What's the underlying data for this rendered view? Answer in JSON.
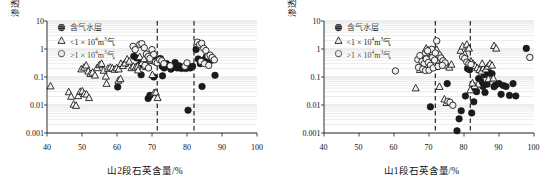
{
  "figure": {
    "panel_count": 2
  },
  "chart_data": [
    {
      "type": "scatter",
      "panel": "left",
      "title": "",
      "xlabel": "山2段石英含量/%",
      "ylabel": "渗透率/10-3μm2",
      "ylabel_main": "渗透率/10",
      "ylabel_exp": "-3",
      "ylabel_unit": "μm",
      "ylabel_unit_exp": "2",
      "xlim": [
        40,
        100
      ],
      "ylim": [
        0.001,
        10
      ],
      "yscale": "log",
      "xticks": [
        40,
        50,
        60,
        70,
        80,
        90,
        100
      ],
      "xticklabels": [
        "40",
        "50",
        "60",
        "70",
        "80",
        "90",
        "100"
      ],
      "yticks": [
        0.001,
        0.01,
        0.1,
        1,
        10
      ],
      "yticklabels": [
        "0.001",
        "0.01",
        "0.1",
        "1",
        "10"
      ],
      "grid": "horizontal-minor",
      "legend_position": "upper-left",
      "annotations": [
        {
          "type": "vline",
          "x": 71.5,
          "style": "dashed"
        },
        {
          "type": "vline",
          "x": 82.0,
          "style": "dashed"
        }
      ],
      "series": [
        {
          "name": "含气水层",
          "marker": "filled-circle",
          "points": [
            [
              60.2,
              0.044
            ],
            [
              62.5,
              0.3
            ],
            [
              64.8,
              0.55
            ],
            [
              65.6,
              0.48
            ],
            [
              66.3,
              0.26
            ],
            [
              67.0,
              0.34
            ],
            [
              68.2,
              0.31
            ],
            [
              68.9,
              0.017
            ],
            [
              69.4,
              0.022
            ],
            [
              70.1,
              0.38
            ],
            [
              70.8,
              0.44
            ],
            [
              71.2,
              0.42
            ],
            [
              71.9,
              0.4
            ],
            [
              72.4,
              0.46
            ],
            [
              72.9,
              0.24
            ],
            [
              73.5,
              0.21
            ],
            [
              74.1,
              0.3
            ],
            [
              74.8,
              0.26
            ],
            [
              75.4,
              0.19
            ],
            [
              75.9,
              0.22
            ],
            [
              76.6,
              0.33
            ],
            [
              77.2,
              0.21
            ],
            [
              77.8,
              0.25
            ],
            [
              78.4,
              0.2
            ],
            [
              79.0,
              0.22
            ],
            [
              79.7,
              0.2
            ],
            [
              80.3,
              0.0065
            ],
            [
              80.9,
              0.21
            ],
            [
              81.6,
              0.24
            ],
            [
              82.6,
              0.96
            ],
            [
              83.2,
              0.44
            ],
            [
              83.8,
              0.3
            ],
            [
              84.3,
              0.046
            ],
            [
              84.9,
              0.41
            ],
            [
              85.5,
              0.52
            ],
            [
              86.1,
              0.34
            ],
            [
              86.7,
              0.38
            ],
            [
              87.3,
              0.47
            ],
            [
              88.0,
              0.115
            ],
            [
              70.5,
              0.1
            ],
            [
              73.0,
              0.11
            ],
            [
              66.9,
              0.12
            ]
          ]
        },
        {
          "name": "<1 × 104m3气",
          "marker": "triangle",
          "points": [
            [
              41.0,
              0.047
            ],
            [
              46.2,
              0.029
            ],
            [
              46.9,
              0.02
            ],
            [
              47.6,
              0.0105
            ],
            [
              48.3,
              0.0095
            ],
            [
              48.9,
              0.021
            ],
            [
              49.5,
              0.03
            ],
            [
              50.1,
              0.031
            ],
            [
              50.7,
              0.025
            ],
            [
              51.3,
              0.024
            ],
            [
              52.0,
              0.018
            ],
            [
              49.8,
              0.19
            ],
            [
              50.6,
              0.22
            ],
            [
              51.2,
              0.26
            ],
            [
              51.8,
              0.16
            ],
            [
              52.4,
              0.13
            ],
            [
              53.0,
              0.145
            ],
            [
              53.7,
              0.115
            ],
            [
              54.3,
              0.21
            ],
            [
              55.0,
              0.27
            ],
            [
              55.6,
              0.3
            ],
            [
              56.2,
              0.17
            ],
            [
              56.8,
              0.105
            ],
            [
              57.4,
              0.2
            ],
            [
              58.1,
              0.22
            ],
            [
              58.7,
              0.205
            ],
            [
              59.3,
              0.185
            ],
            [
              59.9,
              0.21
            ],
            [
              60.5,
              0.19
            ],
            [
              61.1,
              0.3
            ],
            [
              61.7,
              0.25
            ],
            [
              62.3,
              0.31
            ],
            [
              62.9,
              0.43
            ],
            [
              63.5,
              0.36
            ],
            [
              64.1,
              0.21
            ],
            [
              64.7,
              0.24
            ],
            [
              65.3,
              0.22
            ],
            [
              65.9,
              0.24
            ],
            [
              66.5,
              0.52
            ],
            [
              67.1,
              0.32
            ],
            [
              67.7,
              0.44
            ],
            [
              68.3,
              0.23
            ],
            [
              68.9,
              0.24
            ],
            [
              69.5,
              0.4
            ],
            [
              70.1,
              0.12
            ],
            [
              70.6,
              0.027
            ],
            [
              71.1,
              0.028
            ],
            [
              71.6,
              0.018
            ],
            [
              60.4,
              0.075
            ],
            [
              61.0,
              0.085
            ],
            [
              57.0,
              0.058
            ],
            [
              66.0,
              0.175
            ],
            [
              72.1,
              0.42
            ]
          ]
        },
        {
          "name": ">1 × 104m3气",
          "marker": "open-circle",
          "points": [
            [
              64.6,
              1.25
            ],
            [
              65.2,
              0.95
            ],
            [
              66.5,
              1.45
            ],
            [
              67.1,
              1.55
            ],
            [
              67.8,
              1.1
            ],
            [
              68.4,
              0.66
            ],
            [
              68.9,
              0.54
            ],
            [
              69.4,
              0.46
            ],
            [
              70.0,
              0.95
            ],
            [
              70.5,
              0.64
            ],
            [
              71.0,
              0.34
            ],
            [
              71.5,
              0.32
            ],
            [
              72.2,
              0.41
            ],
            [
              72.8,
              0.38
            ],
            [
              73.4,
              0.3
            ],
            [
              75.2,
              0.25
            ],
            [
              79.4,
              0.24
            ],
            [
              80.0,
              0.32
            ],
            [
              83.0,
              1.75
            ],
            [
              83.6,
              1.45
            ],
            [
              84.2,
              1.6
            ],
            [
              84.8,
              1.05
            ],
            [
              85.4,
              0.88
            ],
            [
              86.0,
              0.56
            ],
            [
              86.6,
              0.6
            ],
            [
              87.2,
              0.5
            ],
            [
              87.8,
              0.41
            ],
            [
              84.0,
              0.36
            ],
            [
              85.0,
              0.3
            ],
            [
              86.2,
              0.26
            ],
            [
              68.0,
              0.26
            ],
            [
              69.0,
              0.21
            ]
          ]
        }
      ]
    },
    {
      "type": "scatter",
      "panel": "right",
      "title": "",
      "xlabel": "山1段石英含量/%",
      "ylabel": "渗透率/10-3μm2",
      "ylabel_main": "渗透率/10",
      "ylabel_exp": "-3",
      "ylabel_unit": "μm",
      "ylabel_unit_exp": "2",
      "xlim": [
        40,
        100
      ],
      "ylim": [
        0.001,
        10
      ],
      "yscale": "log",
      "xticks": [
        40,
        50,
        60,
        70,
        80,
        90,
        100
      ],
      "xticklabels": [
        "40",
        "50",
        "60",
        "70",
        "80",
        "90",
        "100"
      ],
      "yticks": [
        0.001,
        0.01,
        0.1,
        1,
        10
      ],
      "yticklabels": [
        "0.001",
        "0.01",
        "0.1",
        "1",
        "10"
      ],
      "grid": "horizontal-minor",
      "legend_position": "upper-left",
      "annotations": [
        {
          "type": "vline",
          "x": 71.8,
          "style": "dashed"
        },
        {
          "type": "vline",
          "x": 81.8,
          "style": "dashed"
        }
      ],
      "series": [
        {
          "name": "含气水层",
          "marker": "filled-circle",
          "points": [
            [
              70.4,
              0.0086
            ],
            [
              75.2,
              0.058
            ],
            [
              78.0,
              0.0012
            ],
            [
              78.6,
              0.0032
            ],
            [
              79.2,
              0.0062
            ],
            [
              80.4,
              0.021
            ],
            [
              81.0,
              0.2
            ],
            [
              81.6,
              0.18
            ],
            [
              82.2,
              0.0052
            ],
            [
              83.0,
              0.042
            ],
            [
              83.6,
              0.03
            ],
            [
              84.2,
              0.088
            ],
            [
              84.8,
              0.07
            ],
            [
              85.4,
              0.046
            ],
            [
              86.0,
              0.028
            ],
            [
              86.6,
              0.055
            ],
            [
              87.2,
              0.14
            ],
            [
              88.0,
              0.13
            ],
            [
              89.0,
              0.052
            ],
            [
              90.0,
              0.058
            ],
            [
              90.6,
              0.024
            ],
            [
              91.2,
              0.05
            ],
            [
              92.0,
              0.046
            ],
            [
              93.0,
              0.022
            ],
            [
              94.0,
              0.058
            ],
            [
              94.8,
              0.021
            ],
            [
              97.8,
              1.05
            ],
            [
              82.8,
              0.013
            ],
            [
              85.8,
              0.12
            ],
            [
              88.6,
              0.045
            ]
          ]
        },
        {
          "name": "<1 × 104m3气",
          "marker": "triangle",
          "points": [
            [
              66.2,
              0.04
            ],
            [
              68.0,
              0.46
            ],
            [
              68.6,
              0.72
            ],
            [
              69.2,
              1.05
            ],
            [
              69.8,
              0.9
            ],
            [
              70.4,
              0.55
            ],
            [
              71.0,
              0.78
            ],
            [
              71.6,
              0.64
            ],
            [
              72.2,
              0.95
            ],
            [
              72.8,
              0.5
            ],
            [
              73.4,
              0.33
            ],
            [
              74.0,
              0.42
            ],
            [
              74.6,
              0.3
            ],
            [
              75.2,
              0.26
            ],
            [
              75.8,
              0.22
            ],
            [
              76.4,
              0.28
            ],
            [
              73.0,
              0.045
            ],
            [
              74.4,
              0.016
            ],
            [
              75.0,
              0.012
            ],
            [
              79.0,
              0.88
            ],
            [
              79.6,
              1.25
            ],
            [
              80.2,
              0.66
            ],
            [
              80.8,
              1.45
            ],
            [
              81.4,
              1.05
            ],
            [
              82.0,
              0.36
            ],
            [
              82.6,
              0.3
            ],
            [
              83.2,
              0.25
            ],
            [
              83.8,
              0.21
            ],
            [
              84.4,
              0.18
            ],
            [
              85.0,
              0.16
            ],
            [
              85.6,
              0.21
            ],
            [
              86.2,
              0.19
            ],
            [
              86.8,
              0.24
            ],
            [
              87.4,
              0.3
            ],
            [
              88.0,
              0.26
            ],
            [
              88.6,
              1.3
            ],
            [
              89.2,
              1.05
            ],
            [
              85.2,
              0.3
            ],
            [
              84.0,
              0.055
            ],
            [
              83.0,
              0.048
            ],
            [
              82.4,
              0.06
            ],
            [
              81.8,
              0.034
            ],
            [
              87.0,
              0.085
            ],
            [
              88.4,
              0.09
            ],
            [
              67.4,
              0.18
            ],
            [
              70.0,
              0.21
            ],
            [
              72.0,
              0.23
            ]
          ]
        },
        {
          "name": ">1 × 104m3气",
          "marker": "open-circle",
          "points": [
            [
              60.4,
              0.165
            ],
            [
              66.8,
              0.42
            ],
            [
              67.4,
              0.58
            ],
            [
              68.0,
              0.36
            ],
            [
              68.6,
              0.3
            ],
            [
              69.2,
              0.44
            ],
            [
              69.8,
              0.33
            ],
            [
              70.4,
              0.26
            ],
            [
              71.0,
              0.5
            ],
            [
              71.6,
              0.4
            ],
            [
              72.2,
              1.95
            ],
            [
              72.8,
              0.62
            ],
            [
              73.4,
              0.48
            ],
            [
              74.0,
              0.38
            ],
            [
              74.6,
              0.32
            ],
            [
              67.0,
              0.22
            ],
            [
              68.2,
              0.19
            ],
            [
              69.0,
              0.17
            ],
            [
              70.0,
              0.175
            ],
            [
              71.2,
              0.21
            ],
            [
              72.6,
              0.24
            ],
            [
              73.8,
              0.26
            ],
            [
              75.4,
              0.0135
            ],
            [
              76.0,
              0.0125
            ],
            [
              76.8,
              0.0098
            ],
            [
              79.6,
              0.52
            ],
            [
              80.2,
              0.46
            ],
            [
              80.8,
              0.34
            ],
            [
              81.4,
              0.3
            ],
            [
              82.0,
              0.28
            ],
            [
              98.8,
              0.5
            ],
            [
              70.8,
              0.98
            ],
            [
              69.6,
              0.86
            ],
            [
              71.8,
              0.72
            ]
          ]
        }
      ]
    }
  ],
  "legend": {
    "entries": [
      {
        "label": "含气水层",
        "marker": "filled-circle"
      },
      {
        "label_pre": "<1 × 10",
        "label_exp": "4",
        "label_post": "m",
        "label_exp2": "3",
        "label_tail": "气",
        "marker": "triangle"
      },
      {
        "label_pre": ">1 × 10",
        "label_exp": "4",
        "label_post": "m",
        "label_exp2": "3",
        "label_tail": "气",
        "marker": "open-circle"
      }
    ]
  },
  "colors": {
    "filled": "#1c1c1c",
    "open_fill": "#f2f2f2",
    "stroke": "#1c1c1c",
    "grid": "#d8d8d8",
    "axis": "#1a1a1a"
  }
}
